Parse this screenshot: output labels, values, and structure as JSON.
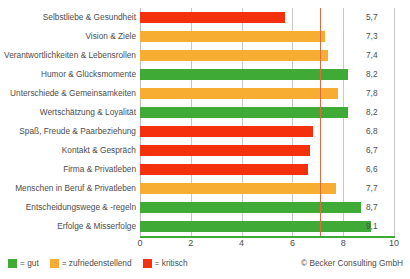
{
  "chart_data": {
    "type": "bar",
    "orientation": "horizontal",
    "title": "",
    "xlabel": "",
    "ylabel": "",
    "xlim": [
      0,
      10
    ],
    "xticks": [
      "0",
      "2",
      "4",
      "6",
      "8",
      "10"
    ],
    "grid": true,
    "reference_line": 7.1,
    "categories": [
      "Selbstliebe & Gesundheit",
      "Vision & Ziele",
      "Verantwortlichkeiten & Lebensrollen",
      "Humor & Glücksmomente",
      "Unterschiede & Gemeinsamkeiten",
      "Wertschätzung & Loyalität",
      "Spaß, Freude & Paarbeziehung",
      "Kontakt & Gespräch",
      "Firma & Privatleben",
      "Menschen in Beruf & Privatleben",
      "Entscheidungswege & -regeln",
      "Erfolge & Misserfolge"
    ],
    "values": [
      5.7,
      7.3,
      7.4,
      8.2,
      7.8,
      8.2,
      6.8,
      6.7,
      6.6,
      7.7,
      8.7,
      9.1
    ],
    "value_labels": [
      "5,7",
      "7,3",
      "7,4",
      "8,2",
      "7,8",
      "8,2",
      "6,8",
      "6,7",
      "6,6",
      "7,7",
      "8,7",
      "9,1"
    ],
    "bar_categories": [
      "kritisch",
      "zufriedenstellend",
      "zufriedenstellend",
      "gut",
      "zufriedenstellend",
      "gut",
      "kritisch",
      "kritisch",
      "kritisch",
      "zufriedenstellend",
      "gut",
      "gut"
    ],
    "colors": {
      "gut": "#3faa35",
      "zufriedenstellend": "#f7ad31",
      "kritisch": "#f5300c",
      "reference_line": "#e06a3a",
      "gridline": "#c9c9c9",
      "axis": "#3faa35",
      "text": "#4d4d4d"
    },
    "legend": {
      "position": "bottom-left",
      "entries": [
        {
          "key": "gut",
          "label": "= gut"
        },
        {
          "key": "zufriedenstellend",
          "label": "= zufriedenstellend"
        },
        {
          "key": "kritisch",
          "label": "= kritisch"
        }
      ]
    },
    "annotations": {
      "copyright": "© Becker Consulting GmbH"
    }
  }
}
